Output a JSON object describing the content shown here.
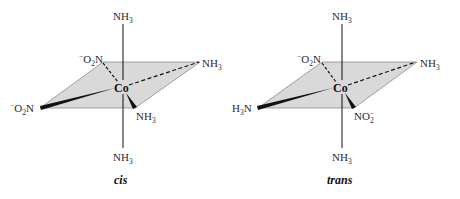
{
  "colors": {
    "plane_fill": "#d9d9d9",
    "plane_stroke": "#8a8a8a",
    "bond": "#111111",
    "text": "#2a2a2a"
  },
  "cis": {
    "caption": "cis",
    "center": "Co",
    "top": {
      "base": "NH",
      "sub": "3"
    },
    "bottom": {
      "base": "NH",
      "sub": "3"
    },
    "back_left": {
      "sup": "−",
      "base": "O",
      "sub": "2",
      "tail": "N"
    },
    "back_right": {
      "base": "NH",
      "sub": "3"
    },
    "front_left": {
      "sup": "−",
      "base": "O",
      "sub": "2",
      "tail": "N"
    },
    "front_right": {
      "base": "NH",
      "sub": "3"
    }
  },
  "trans": {
    "caption": "trans",
    "center": "Co",
    "top": {
      "base": "NH",
      "sub": "3"
    },
    "bottom": {
      "base": "NH",
      "sub": "3"
    },
    "back_left": {
      "sup": "−",
      "base": "O",
      "sub": "2",
      "tail": "N"
    },
    "back_right": {
      "base": "NH",
      "sub": "3"
    },
    "front_left": {
      "base": "H",
      "sub": "3",
      "tail": "N"
    },
    "front_right": {
      "base": "NO",
      "sub": "2",
      "sup": "−"
    }
  }
}
